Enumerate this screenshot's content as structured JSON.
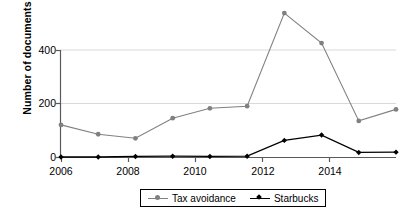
{
  "chart_data": {
    "type": "line",
    "title": "",
    "xlabel": "",
    "ylabel": "Number of documents",
    "x": [
      2006,
      2007,
      2008,
      2009,
      2010,
      2011,
      2012,
      2013,
      2014,
      2015
    ],
    "xtick_labels": [
      "2006",
      "2008",
      "2010",
      "2012",
      "2014"
    ],
    "xticks": [
      2006,
      2008,
      2010,
      2012,
      2014
    ],
    "ytick_labels": [
      "0",
      "200",
      "400"
    ],
    "yticks": [
      0,
      200,
      400
    ],
    "ylim": [
      0,
      560
    ],
    "xlim": [
      2006,
      2015
    ],
    "grid": "horizontal",
    "legend_position": "bottom-center",
    "series": [
      {
        "name": "Tax avoidance",
        "color": "#808080",
        "marker": "circle",
        "values": [
          120,
          85,
          70,
          145,
          182,
          190,
          538,
          426,
          135,
          178
        ]
      },
      {
        "name": "Starbucks",
        "color": "#000000",
        "marker": "diamond",
        "values": [
          0,
          0,
          2,
          3,
          2,
          3,
          62,
          82,
          17,
          18
        ]
      }
    ]
  },
  "axis": {
    "y_title": "Number of documents",
    "y_ticks": [
      "400",
      "200",
      "0"
    ],
    "x_ticks": [
      "2006",
      "2008",
      "2010",
      "2012",
      "2014"
    ]
  },
  "legend": {
    "items": [
      {
        "label": "Tax avoidance",
        "color": "#808080",
        "marker": "circle"
      },
      {
        "label": "Starbucks",
        "color": "#000000",
        "marker": "diamond"
      }
    ]
  },
  "colors": {
    "tax_avoidance": "#808080",
    "starbucks": "#000000",
    "axis": "#595959",
    "gridline": "#d9d9d9",
    "background": "#ffffff"
  }
}
